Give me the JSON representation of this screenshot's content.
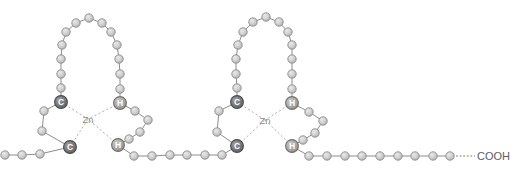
{
  "figure": {
    "width": 522,
    "height": 170,
    "background_color": "#ffffff"
  },
  "labels": {
    "zinc_symbol": "Zn",
    "cysteine_symbol": "C",
    "histidine_symbol": "H",
    "c_terminus": "COOH"
  },
  "colors": {
    "plain_residue_fill": "#cfcfcf",
    "plain_residue_stroke": "#8a8a8a",
    "cysteine_fill": "#777777",
    "histidine_fill": "#a8a8a8",
    "bond_stroke": "#8d8d8d",
    "coordination_stroke": "#a8a8a8",
    "zinc_text": "#8e8e8e",
    "terminus_text": "#5d5d5d"
  },
  "geometry": {
    "bead_radius": 4.2,
    "key_bead_radius": 6.4
  },
  "zinc_fingers": [
    {
      "id": "zinc-finger-1",
      "zinc": {
        "x": 88,
        "y": 119
      },
      "key_residues": [
        {
          "name": "cys-1",
          "label": "C",
          "type": "cysteine",
          "x": 61,
          "y": 102
        },
        {
          "name": "cys-2",
          "label": "C",
          "type": "cysteine",
          "x": 70,
          "y": 147
        },
        {
          "name": "his-1",
          "label": "H",
          "type": "histidine",
          "x": 120,
          "y": 103
        },
        {
          "name": "his-2",
          "label": "H",
          "type": "histidine",
          "x": 118,
          "y": 145
        }
      ],
      "hairpin_loop_beads": [
        {
          "x": 61,
          "y": 88
        },
        {
          "x": 61,
          "y": 74
        },
        {
          "x": 61,
          "y": 59
        },
        {
          "x": 62,
          "y": 45
        },
        {
          "x": 66,
          "y": 32
        },
        {
          "x": 76,
          "y": 23
        },
        {
          "x": 89,
          "y": 18
        },
        {
          "x": 102,
          "y": 23
        },
        {
          "x": 111,
          "y": 32
        },
        {
          "x": 117,
          "y": 45
        },
        {
          "x": 119,
          "y": 59
        },
        {
          "x": 120,
          "y": 74
        },
        {
          "x": 120,
          "y": 89
        }
      ],
      "cys_linker_beads": [
        {
          "x": 44,
          "y": 111
        },
        {
          "x": 42,
          "y": 131
        }
      ],
      "his_linker_beads": [
        {
          "x": 135,
          "y": 111
        },
        {
          "x": 148,
          "y": 120
        },
        {
          "x": 140,
          "y": 132
        },
        {
          "x": 129,
          "y": 139
        }
      ]
    },
    {
      "id": "zinc-finger-2",
      "zinc": {
        "x": 265,
        "y": 120
      },
      "key_residues": [
        {
          "name": "cys-3",
          "label": "C",
          "type": "cysteine",
          "x": 237,
          "y": 102
        },
        {
          "name": "cys-4",
          "label": "C",
          "type": "cysteine",
          "x": 237,
          "y": 146
        },
        {
          "name": "his-3",
          "label": "H",
          "type": "histidine",
          "x": 292,
          "y": 103
        },
        {
          "name": "his-4",
          "label": "H",
          "type": "histidine",
          "x": 292,
          "y": 146
        }
      ],
      "hairpin_loop_beads": [
        {
          "x": 237,
          "y": 88
        },
        {
          "x": 236,
          "y": 74
        },
        {
          "x": 236,
          "y": 59
        },
        {
          "x": 238,
          "y": 45
        },
        {
          "x": 243,
          "y": 32
        },
        {
          "x": 253,
          "y": 22
        },
        {
          "x": 266,
          "y": 17
        },
        {
          "x": 279,
          "y": 22
        },
        {
          "x": 288,
          "y": 32
        },
        {
          "x": 292,
          "y": 45
        },
        {
          "x": 292,
          "y": 59
        },
        {
          "x": 292,
          "y": 74
        },
        {
          "x": 292,
          "y": 89
        }
      ],
      "cys_linker_beads": [
        {
          "x": 219,
          "y": 111
        },
        {
          "x": 217,
          "y": 132
        }
      ],
      "his_linker_beads": [
        {
          "x": 309,
          "y": 112
        },
        {
          "x": 323,
          "y": 121
        },
        {
          "x": 315,
          "y": 133
        },
        {
          "x": 303,
          "y": 140
        }
      ]
    }
  ],
  "backbone_segments": [
    {
      "name": "n-terminal-backbone",
      "beads": [
        {
          "x": 5,
          "y": 155
        },
        {
          "x": 22,
          "y": 155
        },
        {
          "x": 40,
          "y": 154
        }
      ]
    },
    {
      "name": "inter-finger-backbone",
      "beads": [
        {
          "x": 134,
          "y": 156
        },
        {
          "x": 152,
          "y": 156
        },
        {
          "x": 170,
          "y": 155
        },
        {
          "x": 187,
          "y": 155
        },
        {
          "x": 205,
          "y": 155
        },
        {
          "x": 222,
          "y": 155
        }
      ]
    },
    {
      "name": "c-terminal-backbone",
      "beads": [
        {
          "x": 309,
          "y": 156
        },
        {
          "x": 327,
          "y": 156
        },
        {
          "x": 345,
          "y": 156
        },
        {
          "x": 362,
          "y": 156
        },
        {
          "x": 380,
          "y": 156
        },
        {
          "x": 398,
          "y": 156
        },
        {
          "x": 415,
          "y": 156
        },
        {
          "x": 433,
          "y": 156
        },
        {
          "x": 450,
          "y": 156
        }
      ]
    }
  ],
  "terminus": {
    "name": "c-terminus",
    "label": "COOH",
    "label_x": 477,
    "label_y": 156,
    "dash_from_x": 456,
    "dash_to_x": 475,
    "dash_y": 156
  }
}
